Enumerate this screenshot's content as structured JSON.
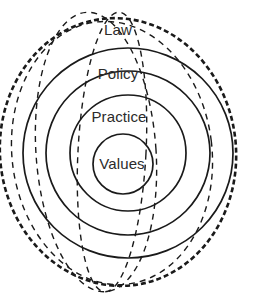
{
  "figure": {
    "type": "concentric-rings-venn",
    "width": 257,
    "height": 301,
    "background_color": "#ffffff",
    "stroke_color": "#1a1a1a",
    "text_color": "#2b2b2b"
  },
  "rings": [
    {
      "id": "law",
      "label": "Law",
      "level": 1,
      "position": "outermost",
      "cx": 128,
      "cy": 153,
      "r": 105,
      "style": "solid",
      "label_x": 118,
      "label_y": 29
    },
    {
      "id": "policy",
      "label": "Policy",
      "level": 2,
      "position": "second",
      "cx": 128,
      "cy": 153,
      "r": 82,
      "style": "solid",
      "label_x": 118,
      "label_y": 73
    },
    {
      "id": "practice",
      "label": "Practice",
      "level": 3,
      "position": "third",
      "cx": 128,
      "cy": 153,
      "r": 58,
      "style": "solid",
      "label_x": 119,
      "label_y": 116
    },
    {
      "id": "values",
      "label": "Values",
      "level": 4,
      "position": "innermost",
      "cx": 123,
      "cy": 164,
      "r": 30,
      "style": "solid",
      "label_x": 122,
      "label_y": 163
    }
  ],
  "overlay_curves": [
    {
      "id": "heavy-dashed-right",
      "style": "dashed",
      "weight": "heavy",
      "stroke_width": 2.6,
      "dash_pattern": "5 3",
      "cx": 118,
      "cy": 152,
      "rx": 118,
      "ry": 134,
      "rotate": -6
    },
    {
      "id": "thin-dashed-left",
      "style": "dashed",
      "weight": "thin",
      "stroke_width": 1.4,
      "dash_pattern": "6 5",
      "cx": 96,
      "cy": 152,
      "rx": 60,
      "ry": 140,
      "rotate": -4
    },
    {
      "id": "thin-dashed-center",
      "style": "dashed",
      "weight": "thin",
      "stroke_width": 1.4,
      "dash_pattern": "6 5",
      "cx": 112,
      "cy": 152,
      "rx": 34,
      "ry": 140,
      "rotate": 3
    },
    {
      "id": "thin-dashed-wide",
      "style": "dashed",
      "weight": "thin",
      "stroke_width": 1.4,
      "dash_pattern": "6 5",
      "cx": 112,
      "cy": 153,
      "rx": 100,
      "ry": 132,
      "rotate": -7
    }
  ]
}
